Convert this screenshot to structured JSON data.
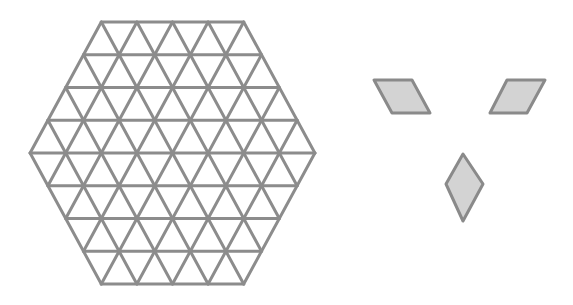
{
  "diagram": {
    "colors": {
      "background": "#ffffff",
      "grid_stroke": "#8c8c8c",
      "tile_fill": "#d3d3d3",
      "tile_stroke": "#8a8a8a"
    },
    "hexagon_grid": {
      "side_length_units": 4,
      "unit_width_px": 35.6,
      "row_height_px": 32.75,
      "center": [
        172.5,
        153
      ],
      "stroke_width": 3
    },
    "rhombi": [
      {
        "name": "rhombus-tilted-left",
        "points": [
          [
            374,
            80
          ],
          [
            412,
            80
          ],
          [
            430,
            113
          ],
          [
            392,
            113
          ]
        ]
      },
      {
        "name": "rhombus-tilted-right",
        "points": [
          [
            507,
            80
          ],
          [
            545,
            80
          ],
          [
            527,
            113
          ],
          [
            490,
            113
          ]
        ]
      },
      {
        "name": "rhombus-vertical",
        "points": [
          [
            463,
            154
          ],
          [
            483,
            184
          ],
          [
            463,
            221
          ],
          [
            446,
            184
          ]
        ]
      }
    ]
  }
}
